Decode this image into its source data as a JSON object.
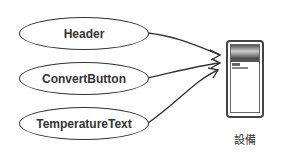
{
  "diagram": {
    "components": [
      {
        "label": "Header"
      },
      {
        "label": "ConvertButton"
      },
      {
        "label": "TemperatureText"
      }
    ],
    "device": {
      "label": "設備",
      "icon": "phone-icon"
    }
  }
}
